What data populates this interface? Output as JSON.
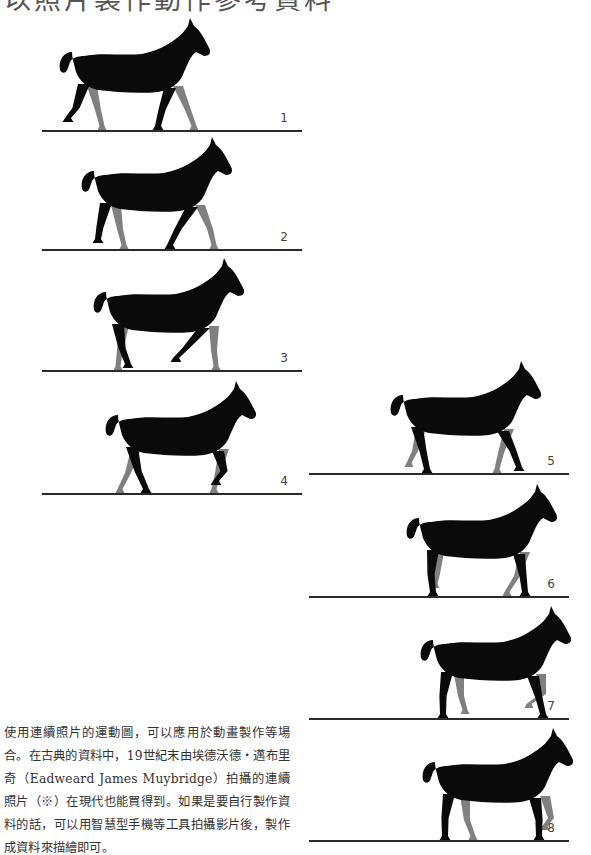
{
  "title": "以照片製作動作參考資料",
  "colors": {
    "horse_body": "#0a0a0a",
    "horse_far_legs": "#808080",
    "ground": "#2a2a2a",
    "background": "#ffffff"
  },
  "frames": [
    {
      "number": "1"
    },
    {
      "number": "2"
    },
    {
      "number": "3"
    },
    {
      "number": "4"
    },
    {
      "number": "5"
    },
    {
      "number": "6"
    },
    {
      "number": "7"
    },
    {
      "number": "8"
    }
  ],
  "caption": "使用連續照片的運動圖，可以應用於動畫製作等場合。在古典的資料中，19世紀末由埃德沃德・邁布里奇（Eadweard James Muybridge）拍攝的連續照片（※）在現代也能買得到。如果是要自行製作資料的話，可以用智慧型手機等工具拍攝影片後，製作成資料來描繪即可。"
}
